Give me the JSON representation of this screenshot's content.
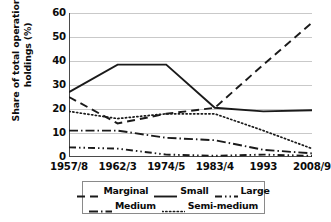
{
  "chart_data": {
    "type": "line",
    "title": "",
    "xlabel": "",
    "ylabel": "Share of total operational holdings (%)",
    "ylabel_line1": "Share of total operational",
    "ylabel_line2": "holdings (%)",
    "categories": [
      "1957/8",
      "1962/3",
      "1974/5",
      "1983/4",
      "1993",
      "2008/9"
    ],
    "ylim": [
      0,
      60
    ],
    "yticks": [
      0,
      10,
      20,
      30,
      40,
      50,
      60
    ],
    "grid": "horizontal",
    "legend_position": "bottom",
    "series": [
      {
        "name": "Marginal",
        "dash": "dashed",
        "color": "#1a1a1a",
        "values": [
          25,
          14,
          18,
          20.5,
          38.5,
          56
        ]
      },
      {
        "name": "Small",
        "dash": "solid",
        "color": "#1a1a1a",
        "values": [
          27,
          38.5,
          38.5,
          20.5,
          19,
          19.5
        ]
      },
      {
        "name": "Large",
        "dash": "dash-dot",
        "color": "#1a1a1a",
        "values": [
          4,
          3.5,
          1,
          0.5,
          1,
          0.5
        ]
      },
      {
        "name": "Medium",
        "dash": "long-dash-dot",
        "color": "#1a1a1a",
        "values": [
          11,
          11,
          8,
          7,
          3,
          1.5
        ]
      },
      {
        "name": "Semi-medium",
        "dash": "dotted",
        "color": "#1a1a1a",
        "values": [
          19,
          16,
          18,
          18,
          11,
          3.5
        ]
      }
    ],
    "legend_rows": [
      [
        "Marginal",
        "Small",
        "Large"
      ],
      [
        "Medium",
        "Semi-medium"
      ]
    ]
  },
  "axes": {
    "ytick_labels": [
      "60",
      "50",
      "40",
      "30",
      "20",
      "10",
      "0"
    ],
    "xtick_labels": [
      "1957/8",
      "1962/3",
      "1974/5",
      "1983/4",
      "1993",
      "2008/9"
    ]
  },
  "legend": {
    "items": [
      {
        "label": "Marginal",
        "dash": "dashed"
      },
      {
        "label": "Small",
        "dash": "solid"
      },
      {
        "label": "Large",
        "dash": "dash-dot"
      },
      {
        "label": "Medium",
        "dash": "long-dash-dot"
      },
      {
        "label": "Semi-medium",
        "dash": "dotted"
      }
    ]
  },
  "colors": {
    "line": "#1a1a1a",
    "grid": "#c9c9c9",
    "axis": "#4a4a4a",
    "legend_border": "#8a8a8a",
    "background": "#ffffff"
  }
}
